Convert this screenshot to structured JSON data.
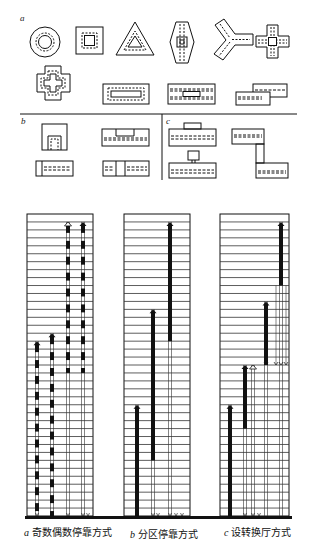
{
  "figure": {
    "top_section": {
      "panel_a": {
        "label": "a",
        "shapes": [
          "circular-core-plan",
          "square-core-plan",
          "triangular-core-plan",
          "hexagonal-core-plan",
          "y-shaped-plan",
          "cross-shaped-plan",
          "stepped-cross-plan",
          "rectangular-central-core-plan",
          "rectangular-double-corridor-plan",
          "offset-slab-plan"
        ]
      },
      "panel_b": {
        "label": "b",
        "shapes": [
          "square-end-core-plan",
          "slab-with-side-core-plan",
          "slab-with-end-core-plan",
          "slab-with-middle-core-plan"
        ]
      },
      "panel_c": {
        "label": "c",
        "shapes": [
          "slab-with-attached-core-plan",
          "L-connected-slabs-plan",
          "slab-with-detached-core-plan"
        ]
      }
    },
    "elevator_diagrams": [
      {
        "id": "a",
        "letter": "a",
        "caption": "奇数偶数停靠方式",
        "floors": 38,
        "description": "odd/even floor stopping; dashed-bar shafts"
      },
      {
        "id": "b",
        "letter": "b",
        "caption": "分区停靠方式",
        "floors": 38,
        "description": "zoned stopping (low / mid / high zones)"
      },
      {
        "id": "c",
        "letter": "c",
        "caption": "设转换厅方式",
        "floors": 38,
        "description": "sky-lobby transfer stopping"
      }
    ]
  }
}
